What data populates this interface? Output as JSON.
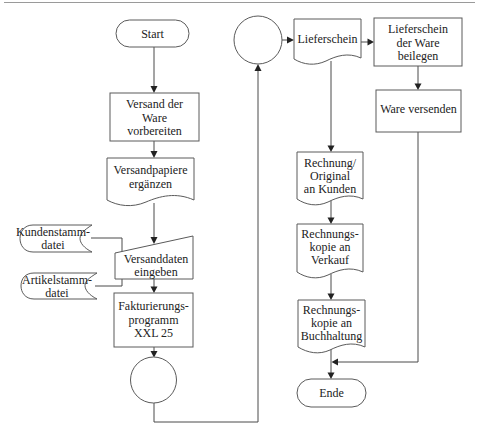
{
  "diagram": {
    "type": "flowchart",
    "language": "de",
    "colors": {
      "stroke": "#5a5a5a",
      "text": "#222222",
      "background": "#ffffff",
      "top_rule": "#9a9a9a"
    },
    "nodes": {
      "start": {
        "shape": "terminal",
        "lines": [
          "Start"
        ]
      },
      "prepare": {
        "shape": "process",
        "lines": [
          "Versand der",
          "Ware",
          "vorbereiten"
        ]
      },
      "papers": {
        "shape": "document",
        "lines": [
          "Versandpapiere",
          "ergänzen"
        ]
      },
      "customer_file": {
        "shape": "stored-data",
        "lines": [
          "Kundenstamm-",
          "datei"
        ]
      },
      "article_file": {
        "shape": "stored-data",
        "lines": [
          "Artikelstamm-",
          "datei"
        ]
      },
      "input": {
        "shape": "manual-input",
        "lines": [
          "Versanddaten",
          "eingeben"
        ]
      },
      "billing": {
        "shape": "process",
        "lines": [
          "Fakturierungs-",
          "programm",
          "XXL 25"
        ]
      },
      "connector_bottom": {
        "shape": "connector",
        "lines": []
      },
      "connector_top": {
        "shape": "connector",
        "lines": []
      },
      "delivery_note": {
        "shape": "document",
        "lines": [
          "Lieferschein"
        ]
      },
      "attach_note": {
        "shape": "process",
        "lines": [
          "Lieferschein",
          "der Ware",
          "beilegen"
        ]
      },
      "ship": {
        "shape": "process",
        "lines": [
          "Ware versenden"
        ]
      },
      "invoice_original": {
        "shape": "document",
        "lines": [
          "Rechnung/",
          "Original",
          "an Kunden"
        ]
      },
      "invoice_sales": {
        "shape": "document",
        "lines": [
          "Rechnungs-",
          "kopie an",
          "Verkauf"
        ]
      },
      "invoice_accounting": {
        "shape": "document",
        "lines": [
          "Rechnungs-",
          "kopie an",
          "Buchhaltung"
        ]
      },
      "end": {
        "shape": "terminal",
        "lines": [
          "Ende"
        ]
      }
    },
    "edges": [
      [
        "start",
        "prepare"
      ],
      [
        "prepare",
        "papers"
      ],
      [
        "papers",
        "input"
      ],
      [
        "customer_file",
        "input"
      ],
      [
        "article_file",
        "input"
      ],
      [
        "input",
        "billing"
      ],
      [
        "billing",
        "connector_bottom"
      ],
      [
        "connector_bottom",
        "connector_top"
      ],
      [
        "connector_top",
        "delivery_note"
      ],
      [
        "delivery_note",
        "attach_note"
      ],
      [
        "attach_note",
        "ship"
      ],
      [
        "delivery_note",
        "invoice_original"
      ],
      [
        "invoice_original",
        "invoice_sales"
      ],
      [
        "invoice_sales",
        "invoice_accounting"
      ],
      [
        "invoice_accounting",
        "end"
      ],
      [
        "ship",
        "end"
      ]
    ]
  }
}
